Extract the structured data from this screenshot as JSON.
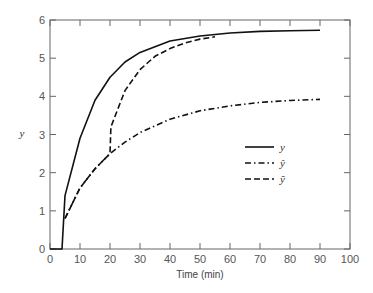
{
  "chart_data": {
    "type": "line",
    "title": "",
    "xlabel": "Time (min)",
    "ylabel": "y",
    "xlim": [
      0,
      100
    ],
    "ylim": [
      0,
      6
    ],
    "xticks": [
      "0",
      "10",
      "20",
      "30",
      "40",
      "50",
      "60",
      "70",
      "80",
      "90",
      "100"
    ],
    "yticks": [
      "0",
      "1",
      "2",
      "3",
      "4",
      "5",
      "6"
    ],
    "grid": false,
    "legend_position": "center-right",
    "series": [
      {
        "name": "y",
        "style": "solid",
        "x": [
          0,
          4,
          5,
          10,
          15,
          20,
          25,
          30,
          40,
          50,
          60,
          70,
          80,
          90
        ],
        "values": [
          0,
          0,
          1.4,
          2.9,
          3.9,
          4.5,
          4.9,
          5.15,
          5.45,
          5.58,
          5.66,
          5.7,
          5.72,
          5.73
        ]
      },
      {
        "name": "ŷ",
        "style": "dashdot",
        "x": [
          5,
          10,
          15,
          20,
          25,
          30,
          40,
          50,
          60,
          70,
          80,
          90
        ],
        "values": [
          0.8,
          1.6,
          2.1,
          2.5,
          2.8,
          3.05,
          3.4,
          3.62,
          3.75,
          3.84,
          3.89,
          3.92
        ]
      },
      {
        "name": "ỹ",
        "style": "dashed",
        "x": [
          5,
          10,
          15,
          20,
          20.3,
          25,
          30,
          35,
          40,
          45,
          50,
          55
        ],
        "values": [
          0.8,
          1.6,
          2.1,
          2.5,
          3.2,
          4.15,
          4.7,
          5.05,
          5.25,
          5.4,
          5.5,
          5.56
        ]
      }
    ]
  },
  "legend": {
    "items": [
      {
        "label": "y",
        "style": "solid"
      },
      {
        "label": "ŷ",
        "style": "dashdot"
      },
      {
        "label": "ỹ",
        "style": "dashed"
      }
    ]
  },
  "colors": {
    "line": "#111111",
    "axis": "#666666",
    "text": "#555555"
  }
}
